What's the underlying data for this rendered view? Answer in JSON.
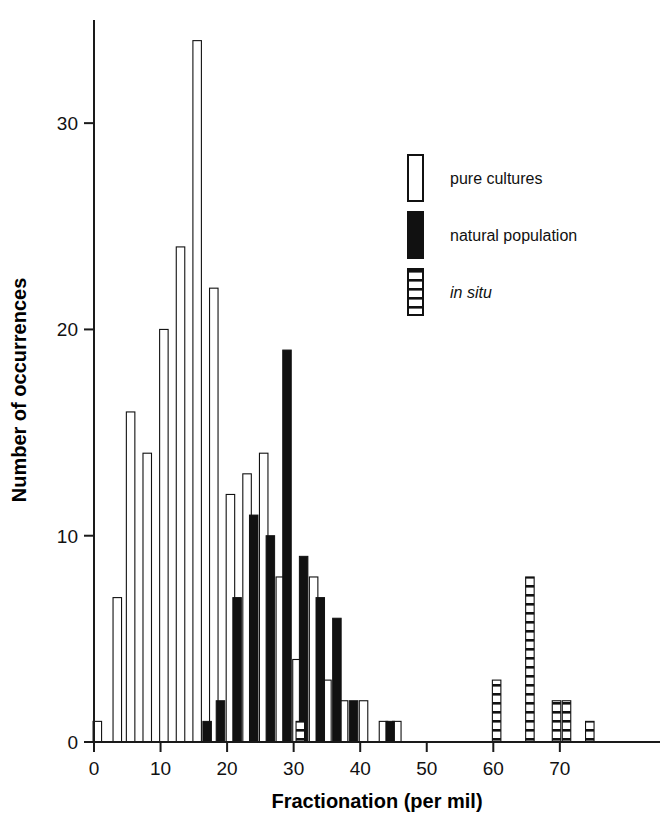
{
  "chart_data": {
    "type": "bar",
    "title": "",
    "subtitle": "",
    "xlabel": "Fractionation (per mil)",
    "ylabel": "Number of occurrences",
    "xlim": [
      -1,
      76
    ],
    "ylim": [
      0,
      35
    ],
    "xticks": [
      0,
      10,
      20,
      30,
      40,
      50,
      60,
      70
    ],
    "xticklabels": [
      "0",
      "10",
      "20",
      "30",
      "40",
      "50",
      "60",
      "70"
    ],
    "yticks": [
      0,
      10,
      20,
      30
    ],
    "yticklabels": [
      "0",
      "10",
      "20",
      "30"
    ],
    "grid": false,
    "legend_position": "upper-right-inside",
    "series": [
      {
        "name": "pure cultures",
        "style": "open",
        "color": "#ffffff",
        "edge_color": "#111111",
        "points": [
          {
            "x": 0.5,
            "y": 1
          },
          {
            "x": 3.5,
            "y": 7
          },
          {
            "x": 5.5,
            "y": 16
          },
          {
            "x": 8,
            "y": 14
          },
          {
            "x": 10.5,
            "y": 20
          },
          {
            "x": 13,
            "y": 24
          },
          {
            "x": 15.5,
            "y": 34
          },
          {
            "x": 18,
            "y": 22
          },
          {
            "x": 20.5,
            "y": 12
          },
          {
            "x": 23,
            "y": 13
          },
          {
            "x": 25.5,
            "y": 14
          },
          {
            "x": 28,
            "y": 8
          },
          {
            "x": 30.5,
            "y": 4
          },
          {
            "x": 33,
            "y": 8
          },
          {
            "x": 35,
            "y": 3
          },
          {
            "x": 37.5,
            "y": 2
          },
          {
            "x": 40.5,
            "y": 2
          },
          {
            "x": 43.5,
            "y": 1
          },
          {
            "x": 45.5,
            "y": 1
          }
        ]
      },
      {
        "name": "natural population",
        "style": "solid",
        "color": "#111111",
        "edge_color": "#111111",
        "points": [
          {
            "x": 17,
            "y": 1
          },
          {
            "x": 19,
            "y": 2
          },
          {
            "x": 21.5,
            "y": 7
          },
          {
            "x": 24,
            "y": 11
          },
          {
            "x": 26.5,
            "y": 10
          },
          {
            "x": 29,
            "y": 19
          },
          {
            "x": 31.5,
            "y": 9
          },
          {
            "x": 34,
            "y": 7
          },
          {
            "x": 36.5,
            "y": 6
          },
          {
            "x": 39,
            "y": 2
          },
          {
            "x": 44.5,
            "y": 1
          }
        ]
      },
      {
        "name": "in situ",
        "style": "hatched",
        "color": "#ffffff",
        "edge_color": "#111111",
        "points": [
          {
            "x": 31,
            "y": 1
          },
          {
            "x": 60.5,
            "y": 3
          },
          {
            "x": 65.5,
            "y": 8
          },
          {
            "x": 69.5,
            "y": 2
          },
          {
            "x": 71,
            "y": 2
          },
          {
            "x": 74.5,
            "y": 1
          }
        ]
      }
    ],
    "legend_entries": [
      {
        "label": "pure cultures",
        "style": "open",
        "italic": false
      },
      {
        "label": "natural population",
        "style": "solid",
        "italic": false
      },
      {
        "label": "in situ",
        "style": "hatched",
        "italic": true
      }
    ]
  }
}
